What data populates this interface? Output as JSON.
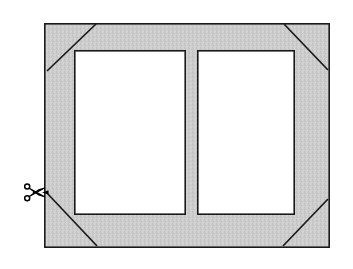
{
  "figure": {
    "kind": "technical-diagram",
    "background_color": "#ffffff"
  },
  "colors": {
    "mat_fill": "#c9c9c9",
    "mat_fill_texture": "#d2d2d2",
    "opening_fill": "#ffffff",
    "outline": "#1a1a1a",
    "corner_line": "#1a1a1a",
    "scissors": "#000000"
  },
  "mat_board": {
    "label": "mat-board",
    "outer": {
      "x": 44,
      "y": 23,
      "width": 286,
      "height": 225
    },
    "border_width": 1.6
  },
  "openings": [
    {
      "label": "left-opening",
      "name": "window-opening-left",
      "x": 74,
      "y": 50,
      "width": 112,
      "height": 165
    },
    {
      "label": "right-opening",
      "name": "window-opening-right",
      "x": 197,
      "y": 50,
      "width": 98,
      "height": 165
    }
  ],
  "corner_cuts": [
    {
      "name": "corner-cut-top-left",
      "x1": 47,
      "y1": 71,
      "x2": 96,
      "y2": 24
    },
    {
      "name": "corner-cut-top-right",
      "x1": 284,
      "y1": 24,
      "x2": 328,
      "y2": 70
    },
    {
      "name": "corner-cut-bottom-right",
      "x1": 328,
      "y1": 199,
      "x2": 283,
      "y2": 246
    },
    {
      "name": "corner-cut-bottom-left",
      "x1": 46,
      "y1": 192,
      "x2": 97,
      "y2": 246
    }
  ],
  "scissors": {
    "name": "scissors-cut-icon",
    "glyph": "✂",
    "x": 24,
    "y": 184,
    "rotation": 0,
    "meaning": "cut-here"
  },
  "annotations": {
    "cut_line_label": "",
    "caption": ""
  }
}
